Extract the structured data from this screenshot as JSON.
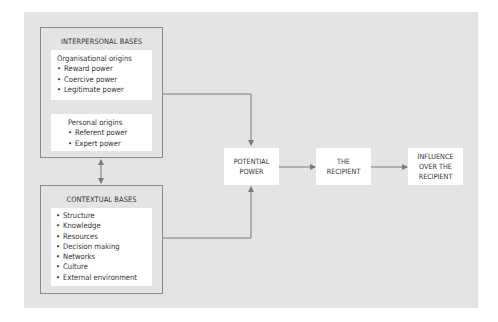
{
  "colors": {
    "panel": "#e4e4e4",
    "box": "#ffffff",
    "border": "#8a8a8a",
    "connector": "#7a7a7a",
    "text": "#333333"
  },
  "interpersonal": {
    "title": "INTERPERSONAL BASES",
    "organisational": {
      "heading": "Organisational origins",
      "items": [
        "Reward power",
        "Coercive power",
        "Legitimate power"
      ]
    },
    "personal": {
      "heading": "Personal origins",
      "items": [
        "Referent power",
        "Expert power"
      ]
    }
  },
  "contextual": {
    "title": "CONTEXTUAL BASES",
    "items": [
      "Structure",
      "Knowledge",
      "Resources",
      "Decision making",
      "Networks",
      "Culture",
      "External environment"
    ]
  },
  "flow": {
    "potential_power": [
      "POTENTIAL",
      "POWER"
    ],
    "recipient": [
      "THE",
      "RECIPIENT"
    ],
    "influence": [
      "INFLUENCE",
      "OVER THE",
      "RECIPIENT"
    ]
  },
  "connectors": [
    {
      "from": "interpersonal-bases",
      "to": "potential-power",
      "type": "arrow"
    },
    {
      "from": "contextual-bases",
      "to": "potential-power",
      "type": "arrow"
    },
    {
      "from": "interpersonal-bases",
      "to": "contextual-bases",
      "type": "double-arrow"
    },
    {
      "from": "potential-power",
      "to": "the-recipient",
      "type": "arrow"
    },
    {
      "from": "the-recipient",
      "to": "influence-over-recipient",
      "type": "arrow"
    }
  ]
}
